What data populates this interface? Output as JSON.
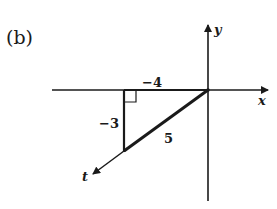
{
  "figure": {
    "panel_label": "(b)",
    "axes": {
      "x_label": "x",
      "y_label": "y",
      "t_label": "t"
    },
    "triangle": {
      "horizontal_leg_label": "−4",
      "vertical_leg_label": "−3",
      "hypotenuse_label": "5",
      "right_angle_marker": true
    },
    "colors": {
      "ink": "#1a1a1a",
      "background": "#ffffff"
    }
  }
}
